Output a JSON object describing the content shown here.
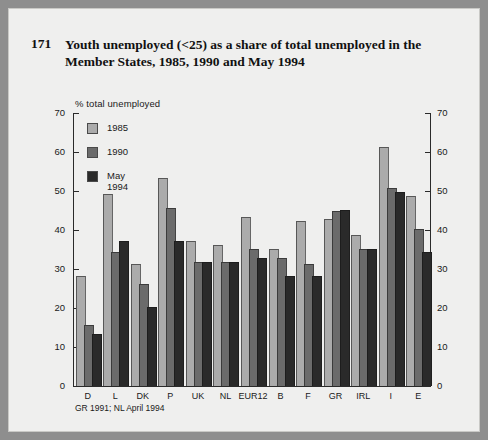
{
  "page": {
    "number": "171",
    "title": "Youth unemployed (<25) as a share of total unemployed in  the Member States, 1985, 1990 and May 1994"
  },
  "axis": {
    "unit_label": "% total unemployed",
    "y_ticks": [
      "70",
      "60",
      "50",
      "40",
      "30",
      "20",
      "10",
      "0"
    ]
  },
  "footnote": "GR 1991; NL April 1994",
  "legend": [
    {
      "label": "1985",
      "color": "#ababab"
    },
    {
      "label": "1990",
      "color": "#6b6b6b"
    },
    {
      "label": "May 1994",
      "color": "#2a2a2a"
    }
  ],
  "chart_data": {
    "type": "bar",
    "title": "Youth unemployed (<25) as a share of total unemployed in  the Member States, 1985, 1990 and May 1994",
    "xlabel": "",
    "ylabel": "% total unemployed",
    "ylim": [
      0,
      70
    ],
    "ytick_step": 10,
    "grid": false,
    "legend_position": "top-left",
    "categories": [
      "D",
      "L",
      "DK",
      "P",
      "UK",
      "NL",
      "EUR12",
      "B",
      "F",
      "GR",
      "IRL",
      "I",
      "E"
    ],
    "series": [
      {
        "name": "1985",
        "color": "#ababab",
        "values": [
          28.0,
          49.0,
          31.0,
          53.0,
          37.0,
          36.0,
          43.0,
          35.0,
          42.0,
          42.5,
          38.5,
          61.0,
          48.5
        ]
      },
      {
        "name": "1990",
        "color": "#6b6b6b",
        "values": [
          15.5,
          34.0,
          26.0,
          45.5,
          31.5,
          31.5,
          35.0,
          32.5,
          31.0,
          44.5,
          35.0,
          50.5,
          40.0
        ]
      },
      {
        "name": "May 1994",
        "color": "#2a2a2a",
        "values": [
          13.0,
          37.0,
          20.0,
          37.0,
          31.5,
          31.5,
          32.5,
          28.0,
          28.0,
          45.0,
          35.0,
          49.5,
          34.0
        ]
      }
    ]
  }
}
